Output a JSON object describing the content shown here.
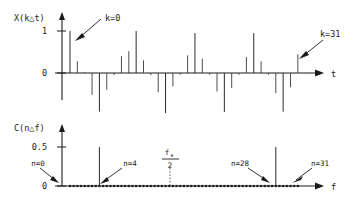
{
  "figure": {
    "title": ""
  },
  "chart_data": [
    {
      "type": "bar",
      "name": "time-domain-signal",
      "title": "",
      "ylabel": "X(k△t)",
      "xlabel": "t",
      "ytick_labels": [
        "1",
        "0"
      ],
      "ytick_values": [
        1,
        0
      ],
      "ylim": [
        -1.05,
        1.15
      ],
      "xlim": [
        -0.8,
        33
      ],
      "grid": false,
      "legend": null,
      "annotations": [
        {
          "text": "k=0",
          "points_to_index": 0
        },
        {
          "text": "k=31",
          "points_to_index": 31
        }
      ],
      "categories": [
        0,
        1,
        2,
        3,
        4,
        5,
        6,
        7,
        8,
        9,
        10,
        11,
        12,
        13,
        14,
        15,
        16,
        17,
        18,
        19,
        20,
        21,
        22,
        23,
        24,
        25,
        26,
        27,
        28,
        29,
        30,
        31
      ],
      "values": [
        1.0,
        0.28,
        0.02,
        -0.52,
        -0.92,
        -0.4,
        -0.05,
        0.4,
        0.52,
        1.0,
        0.3,
        -0.05,
        -0.46,
        -0.95,
        -0.32,
        -0.04,
        0.42,
        0.95,
        0.34,
        -0.04,
        -0.44,
        -0.93,
        -0.36,
        -0.04,
        0.38,
        0.95,
        0.28,
        -0.04,
        -0.48,
        -0.92,
        -0.34,
        0.45
      ]
    },
    {
      "type": "bar",
      "name": "dft-magnitude",
      "title": "",
      "ylabel": "C(n△f)",
      "xlabel": "f",
      "ytick_labels": [
        "0.5",
        "0"
      ],
      "ytick_values": [
        0.5,
        0
      ],
      "ylim": [
        0,
        0.62
      ],
      "xlim": [
        -0.8,
        33
      ],
      "grid": false,
      "legend": null,
      "nyquist_label": "fₛ/2",
      "nyquist_index": 16,
      "annotations": [
        {
          "text": "n=0",
          "points_to_index": 0
        },
        {
          "text": "n=4",
          "points_to_index": 4
        },
        {
          "text": "n=28",
          "points_to_index": 28
        },
        {
          "text": "n=31",
          "points_to_index": 31
        }
      ],
      "categories": [
        0,
        1,
        2,
        3,
        4,
        5,
        6,
        7,
        8,
        9,
        10,
        11,
        12,
        13,
        14,
        15,
        16,
        17,
        18,
        19,
        20,
        21,
        22,
        23,
        24,
        25,
        26,
        27,
        28,
        29,
        30,
        31
      ],
      "values": [
        0,
        0,
        0,
        0,
        0.5,
        0,
        0,
        0,
        0,
        0,
        0,
        0,
        0,
        0,
        0,
        0,
        0,
        0,
        0,
        0,
        0,
        0,
        0,
        0,
        0,
        0,
        0,
        0,
        0.5,
        0,
        0,
        0
      ]
    }
  ],
  "top_chart": {
    "ylabel": "X(k△t)",
    "xlabel": "t",
    "ytick_one": "1",
    "ytick_zero": "0",
    "annotation_left": "k=0",
    "annotation_right": "k=31"
  },
  "bottom_chart": {
    "ylabel": "C(n△f)",
    "xlabel": "f",
    "ytick_half": "0.5",
    "ytick_zero": "0",
    "nyquist_numerator": "f",
    "nyquist_subscript": "s",
    "nyquist_denominator": "2",
    "annotation_n0": "n=0",
    "annotation_n4": "n=4",
    "annotation_n28": "n=28",
    "annotation_n31": "n=31"
  },
  "colors": {
    "ink": "#1a1a1a",
    "stem": "#2a2a2a",
    "background": "#ffffff"
  }
}
